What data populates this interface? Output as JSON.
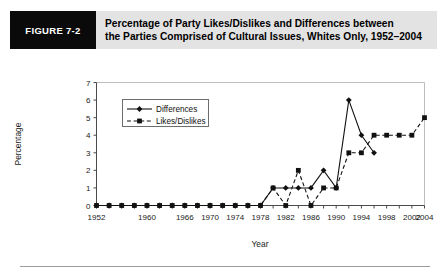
{
  "figure": {
    "number_label": "FIGURE 7-2",
    "title_line1": "Percentage of Party Likes/Dislikes and Differences between",
    "title_line2": "the Parties Comprised of Cultural Issues, Whites Only, 1952–2004",
    "header_bg": "#e3e3e3",
    "number_bg": "#0a0a0a",
    "number_fg": "#ffffff"
  },
  "chart_data": {
    "type": "line",
    "title": "Percentage of Party Likes/Dislikes and Differences between the Parties Comprised of Cultural Issues, Whites Only, 1952–2004",
    "xlabel": "Year",
    "ylabel": "Percentage",
    "ylim": [
      0,
      7
    ],
    "yticks": [
      0,
      1,
      2,
      3,
      4,
      5,
      6,
      7
    ],
    "ytick_labels": [
      "0",
      "1",
      "2",
      "3",
      "4",
      "5",
      "6",
      "7"
    ],
    "xlim": [
      1952,
      2004
    ],
    "xticks": [
      1952,
      1954,
      1956,
      1958,
      1960,
      1962,
      1964,
      1966,
      1968,
      1970,
      1972,
      1974,
      1976,
      1978,
      1980,
      1982,
      1984,
      1986,
      1988,
      1990,
      1992,
      1994,
      1996,
      1998,
      2000,
      2002,
      2004
    ],
    "xtick_labels": [
      "1952",
      "1960",
      "1966",
      "1970",
      "1974",
      "1978",
      "1982",
      "1986",
      "1990",
      "1994",
      "1998",
      "2002",
      "2004"
    ],
    "xtick_label_years": [
      1952,
      1960,
      1966,
      1970,
      1974,
      1978,
      1982,
      1986,
      1990,
      1994,
      1998,
      2002,
      2004
    ],
    "grid": false,
    "legend_position": "upper-left-inside",
    "x": [
      1952,
      1954,
      1956,
      1958,
      1960,
      1962,
      1964,
      1966,
      1968,
      1970,
      1972,
      1974,
      1976,
      1978,
      1980,
      1982,
      1984,
      1986,
      1988,
      1990,
      1992,
      1994,
      1996,
      1998,
      2000,
      2002,
      2004
    ],
    "series": [
      {
        "name": "Differences",
        "marker": "diamond",
        "linestyle": "solid",
        "values": [
          0,
          0,
          0,
          0,
          0,
          0,
          0,
          0,
          0,
          0,
          0,
          0,
          0,
          0,
          1,
          1,
          1,
          1,
          2,
          1,
          6,
          4,
          3,
          null,
          null,
          null,
          null
        ]
      },
      {
        "name": "Likes/Dislikes",
        "marker": "square",
        "linestyle": "dashed",
        "values": [
          0,
          0,
          0,
          0,
          0,
          0,
          0,
          0,
          0,
          0,
          0,
          0,
          0,
          0,
          1,
          0,
          2,
          0,
          1,
          1,
          3,
          3,
          4,
          4,
          4,
          4,
          5
        ]
      }
    ]
  },
  "legend": {
    "items": [
      {
        "label": "Differences",
        "marker": "diamond",
        "linestyle": "solid"
      },
      {
        "label": "Likes/Dislikes",
        "marker": "square",
        "linestyle": "dashed"
      }
    ]
  }
}
